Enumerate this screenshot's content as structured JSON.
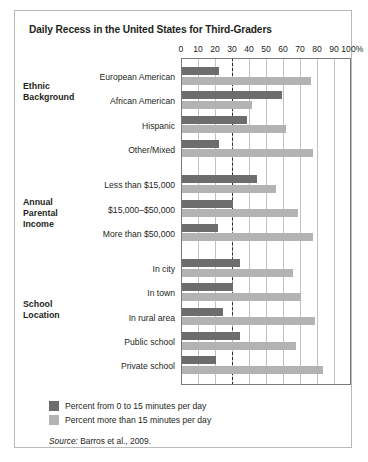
{
  "chart_data": {
    "type": "bar",
    "orientation": "horizontal",
    "title": "Daily Recess in the United States for Third-Graders",
    "xlabel": "",
    "ylabel": "",
    "xlim": [
      0,
      100
    ],
    "xticks": [
      0,
      10,
      20,
      30,
      40,
      50,
      60,
      70,
      80,
      90,
      100
    ],
    "xtick_labels": [
      "0",
      "10",
      "20",
      "30",
      "40",
      "50",
      "60",
      "70",
      "80",
      "90",
      "100%"
    ],
    "grid": true,
    "reference_line": 30,
    "legend_position": "below",
    "series": [
      {
        "name": "Percent from 0 to 15 minutes per day",
        "color": "#6d6d6d",
        "values": [
          22,
          59,
          38,
          22,
          44,
          30,
          21,
          34,
          30,
          24,
          34,
          20
        ]
      },
      {
        "name": "Percent more than 15 minutes per day",
        "color": "#b3b3b3",
        "values": [
          76,
          41,
          61,
          77,
          55,
          68,
          77,
          65,
          70,
          78,
          67,
          83
        ]
      }
    ],
    "categories": [
      "European American",
      "African American",
      "Hispanic",
      "Other/Mixed",
      "Less than $15,000",
      "$15,000–$50,000",
      "More than $50,000",
      "In city",
      "In town",
      "In rural area",
      "Public school",
      "Private school"
    ],
    "groups": [
      {
        "label": "Ethnic\nBackground",
        "label_lines": [
          "Ethnic",
          "Background"
        ],
        "start": 0,
        "count": 4
      },
      {
        "label": "Annual\nParental\nIncome",
        "label_lines": [
          "Annual",
          "Parental",
          "Income"
        ],
        "start": 4,
        "count": 3
      },
      {
        "label": "School\nLocation",
        "label_lines": [
          "School",
          "Location"
        ],
        "start": 7,
        "count": 5
      }
    ],
    "source": "Source: Barros et al., 2009.",
    "source_prefix": "Source:",
    "source_rest": " Barros et al., 2009."
  },
  "legend": {
    "items": [
      {
        "label": "Percent from 0 to 15 minutes per day",
        "color": "#6d6d6d"
      },
      {
        "label": "Percent more than 15 minutes per day",
        "color": "#b3b3b3"
      }
    ]
  },
  "colors": {
    "dark": "#6d6d6d",
    "light": "#b3b3b3",
    "frame": "#b9b9b9",
    "grid": "#c2c2c2",
    "text": "#231f20"
  }
}
